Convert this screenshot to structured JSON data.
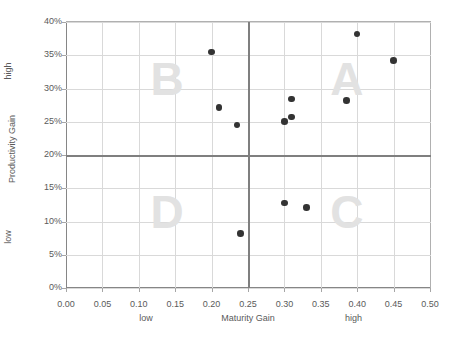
{
  "chart_data": {
    "type": "scatter",
    "title": "",
    "xlabel": "Maturity Gain",
    "ylabel": "Productivity Gain",
    "xlim": [
      0.0,
      0.5
    ],
    "ylim": [
      0.0,
      0.4
    ],
    "grid": true,
    "legend": "none",
    "x_tick_labels": [
      "0.00",
      "0.05",
      "0.10",
      "0.15",
      "0.20",
      "0.25",
      "0.30",
      "0.35",
      "0.40",
      "0.45",
      "0.50"
    ],
    "x_tick_values": [
      0.0,
      0.05,
      0.1,
      0.15,
      0.2,
      0.25,
      0.3,
      0.35,
      0.4,
      0.45,
      0.5
    ],
    "y_tick_labels": [
      "0%",
      "5%",
      "10%",
      "15%",
      "20%",
      "25%",
      "30%",
      "35%",
      "40%"
    ],
    "y_tick_values": [
      0,
      0.05,
      0.1,
      0.15,
      0.2,
      0.25,
      0.3,
      0.35,
      0.4
    ],
    "x_low_label": "low",
    "x_high_label": "high",
    "y_low_label": "low",
    "y_high_label": "high",
    "quadrant_divider_x": 0.25,
    "quadrant_divider_y": 0.2,
    "quadrant_labels": [
      {
        "letter": "A",
        "x": 0.385,
        "y": 0.315
      },
      {
        "letter": "B",
        "x": 0.138,
        "y": 0.315
      },
      {
        "letter": "C",
        "x": 0.385,
        "y": 0.115
      },
      {
        "letter": "D",
        "x": 0.138,
        "y": 0.115
      }
    ],
    "points": [
      {
        "x": 0.2,
        "y": 0.355
      },
      {
        "x": 0.21,
        "y": 0.271
      },
      {
        "x": 0.235,
        "y": 0.245
      },
      {
        "x": 0.24,
        "y": 0.082
      },
      {
        "x": 0.3,
        "y": 0.25
      },
      {
        "x": 0.31,
        "y": 0.257
      },
      {
        "x": 0.31,
        "y": 0.284
      },
      {
        "x": 0.3,
        "y": 0.128
      },
      {
        "x": 0.33,
        "y": 0.121
      },
      {
        "x": 0.385,
        "y": 0.282
      },
      {
        "x": 0.4,
        "y": 0.382
      },
      {
        "x": 0.45,
        "y": 0.342
      }
    ],
    "colors": {
      "point": "#333333",
      "gridline": "#d9d9d9",
      "axis": "#868686",
      "divider": "#7f7f7f",
      "quadrant_letter": "#e2e2e2",
      "text": "#5a5a5a"
    }
  }
}
